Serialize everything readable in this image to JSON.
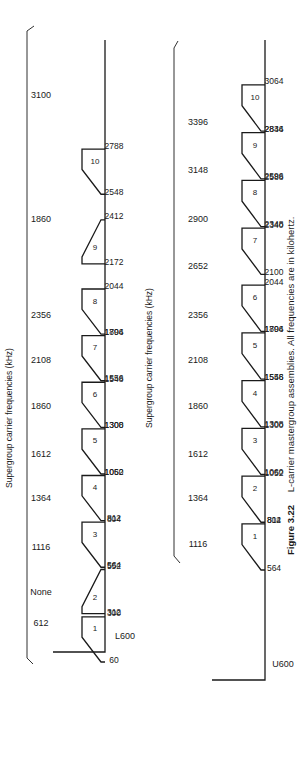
{
  "figure": {
    "number": "Figure 3.22",
    "caption": "L-carrier mastergroup assemblies. All frequencies are in kilohertz."
  },
  "l600": {
    "label": "L600",
    "header": "Supergroup carrier frequencies (kHz)",
    "carriers": [
      "612",
      "None",
      "1116",
      "1364",
      "1612",
      "1860",
      "2108",
      "2356",
      "1860",
      "3100"
    ],
    "blocks": [
      {
        "num": "1",
        "low": "60",
        "high": "300",
        "lo": 60,
        "hi": 300,
        "orient": "up"
      },
      {
        "num": "2",
        "low": "312",
        "high": "552",
        "lo": 312,
        "hi": 552,
        "orient": "down"
      },
      {
        "num": "3",
        "low": "564",
        "high": "804",
        "lo": 564,
        "hi": 804,
        "orient": "up"
      },
      {
        "num": "4",
        "low": "812",
        "high": "1052",
        "lo": 812,
        "hi": 1052,
        "orient": "up"
      },
      {
        "num": "5",
        "low": "1060",
        "high": "1300",
        "lo": 1060,
        "hi": 1300,
        "orient": "up"
      },
      {
        "num": "6",
        "low": "1308",
        "high": "1548",
        "lo": 1308,
        "hi": 1548,
        "orient": "up"
      },
      {
        "num": "7",
        "low": "1556",
        "high": "1796",
        "lo": 1556,
        "hi": 1796,
        "orient": "up"
      },
      {
        "num": "8",
        "low": "1804",
        "high": "2044",
        "lo": 1804,
        "hi": 2044,
        "orient": "up"
      },
      {
        "num": "9",
        "low": "2172",
        "high": "2412",
        "lo": 2172,
        "hi": 2412,
        "orient": "down"
      },
      {
        "num": "10",
        "low": "2548",
        "high": "2788",
        "lo": 2548,
        "hi": 2788,
        "orient": "up"
      }
    ]
  },
  "u600": {
    "label": "U600",
    "header": "Supergroup carrier frequencies (kHz)",
    "carriers": [
      "1116",
      "1364",
      "1612",
      "1860",
      "2108",
      "2356",
      "2652",
      "2900",
      "3148",
      "3396"
    ],
    "blocks": [
      {
        "num": "1",
        "low": "564",
        "high": "804",
        "lo": 564,
        "hi": 804
      },
      {
        "num": "2",
        "low": "812",
        "high": "1052",
        "lo": 812,
        "hi": 1052
      },
      {
        "num": "3",
        "low": "1060",
        "high": "1300",
        "lo": 1060,
        "hi": 1300
      },
      {
        "num": "4",
        "low": "1308",
        "high": "1548",
        "lo": 1308,
        "hi": 1548
      },
      {
        "num": "5",
        "low": "1556",
        "high": "1796",
        "lo": 1556,
        "hi": 1796
      },
      {
        "num": "6",
        "low": "1804",
        "high": "2044",
        "lo": 1804,
        "hi": 2044
      },
      {
        "num": "7",
        "low": "2100",
        "high": "2340",
        "lo": 2100,
        "hi": 2340
      },
      {
        "num": "8",
        "low": "2348",
        "high": "2588",
        "lo": 2348,
        "hi": 2588
      },
      {
        "num": "9",
        "low": "2596",
        "high": "2836",
        "lo": 2596,
        "hi": 2836
      },
      {
        "num": "10",
        "low": "2844",
        "high": "3064",
        "lo": 2844,
        "hi": 3084
      }
    ]
  }
}
